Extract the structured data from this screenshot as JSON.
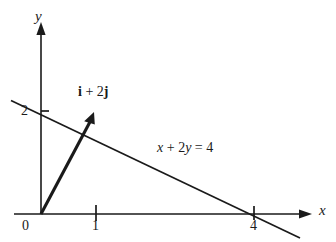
{
  "figure": {
    "type": "math-diagram",
    "background_color": "#ffffff",
    "stroke_color": "#1a1a1a"
  },
  "axes": {
    "x": {
      "name": "x",
      "tick_labels": [
        "0",
        "1",
        "4"
      ],
      "tick_values": [
        0,
        1,
        4
      ],
      "arrow": "right"
    },
    "y": {
      "name": "y",
      "tick_labels": [
        "2"
      ],
      "tick_values": [
        2
      ],
      "arrow": "up"
    }
  },
  "annotations": {
    "vector_label": "i + 2j",
    "vector_label_bold_parts": [
      "i",
      "j"
    ],
    "line_equation": "x + 2y = 4"
  },
  "chart_data": {
    "type": "line",
    "title": "",
    "xlabel": "x",
    "ylabel": "y",
    "grid": false,
    "legend": "none",
    "xlim": [
      -0.6,
      5.1
    ],
    "ylim": [
      -0.3,
      3.8
    ],
    "xticks": [
      0,
      1,
      4
    ],
    "xticklabels": [
      "0",
      "1",
      "4"
    ],
    "yticks": [
      2
    ],
    "yticklabels": [
      "2"
    ],
    "series": [
      {
        "name": "x + 2y = 4",
        "kind": "line",
        "equation": "x + 2y = 4",
        "slope": -0.5,
        "intercept": 2,
        "x": [
          -0.85,
          5.25
        ],
        "y": [
          2.425,
          -0.625
        ],
        "x_intercept": 4,
        "y_intercept": 2,
        "label": "x + 2y = 4"
      },
      {
        "name": "i + 2j",
        "kind": "vector",
        "start": [
          0,
          0
        ],
        "end": [
          1,
          2
        ],
        "components": {
          "i": 1,
          "j": 2
        },
        "label": "i + 2j"
      }
    ],
    "annotations": [
      {
        "text": "i + 2j",
        "x": 1.05,
        "y": 2.6
      },
      {
        "text": "x + 2y = 4",
        "x": 2.5,
        "y": 1.25
      }
    ]
  }
}
